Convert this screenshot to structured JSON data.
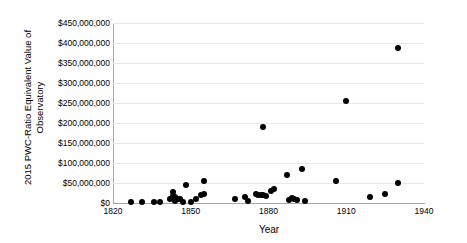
{
  "chart_data": {
    "type": "scatter",
    "title": "",
    "xlabel": "Year",
    "ylabel": "2015 PWC-Ratio Equivalent Value of Observatory",
    "xlim": [
      1820,
      1940
    ],
    "ylim": [
      0,
      450000000
    ],
    "xticks": [
      1820,
      1850,
      1880,
      1910,
      1940
    ],
    "xtick_labels": [
      "1820",
      "1850",
      "1880",
      "1910",
      "1940"
    ],
    "yticks": [
      0,
      50000000,
      100000000,
      150000000,
      200000000,
      250000000,
      300000000,
      350000000,
      400000000,
      450000000
    ],
    "ytick_labels": [
      "$0",
      "$50,000,000",
      "$100,000,000",
      "$150,000,000",
      "$200,000,000",
      "$250,000,000",
      "$300,000,000",
      "$350,000,000",
      "$400,000,000",
      "$450,000,000"
    ],
    "grid": "horizontal",
    "legend": "none",
    "marker_color": "#000000",
    "marker_shape": "circle",
    "points": [
      {
        "x": 1827,
        "y": 2000000
      },
      {
        "x": 1831,
        "y": 3000000
      },
      {
        "x": 1836,
        "y": 3000000
      },
      {
        "x": 1838,
        "y": 3000000
      },
      {
        "x": 1842,
        "y": 9000000
      },
      {
        "x": 1843,
        "y": 17000000
      },
      {
        "x": 1843,
        "y": 27000000
      },
      {
        "x": 1844,
        "y": 6000000
      },
      {
        "x": 1844,
        "y": 14000000
      },
      {
        "x": 1845,
        "y": 11000000
      },
      {
        "x": 1846,
        "y": 9000000
      },
      {
        "x": 1847,
        "y": 3000000
      },
      {
        "x": 1848,
        "y": 46000000
      },
      {
        "x": 1850,
        "y": 2000000
      },
      {
        "x": 1852,
        "y": 9000000
      },
      {
        "x": 1854,
        "y": 19000000
      },
      {
        "x": 1855,
        "y": 54000000
      },
      {
        "x": 1855,
        "y": 22000000
      },
      {
        "x": 1867,
        "y": 11000000
      },
      {
        "x": 1871,
        "y": 15000000
      },
      {
        "x": 1872,
        "y": 5000000
      },
      {
        "x": 1875,
        "y": 23000000
      },
      {
        "x": 1876,
        "y": 19000000
      },
      {
        "x": 1877,
        "y": 21000000
      },
      {
        "x": 1878,
        "y": 21000000
      },
      {
        "x": 1878,
        "y": 189000000
      },
      {
        "x": 1879,
        "y": 18000000
      },
      {
        "x": 1881,
        "y": 29000000
      },
      {
        "x": 1882,
        "y": 35000000
      },
      {
        "x": 1887,
        "y": 70000000
      },
      {
        "x": 1888,
        "y": 7000000
      },
      {
        "x": 1889,
        "y": 12000000
      },
      {
        "x": 1890,
        "y": 11000000
      },
      {
        "x": 1891,
        "y": 8000000
      },
      {
        "x": 1893,
        "y": 86000000
      },
      {
        "x": 1894,
        "y": 5000000
      },
      {
        "x": 1906,
        "y": 56000000
      },
      {
        "x": 1910,
        "y": 254000000
      },
      {
        "x": 1919,
        "y": 16000000
      },
      {
        "x": 1925,
        "y": 23000000
      },
      {
        "x": 1930,
        "y": 388000000
      },
      {
        "x": 1930,
        "y": 50000000
      }
    ]
  }
}
